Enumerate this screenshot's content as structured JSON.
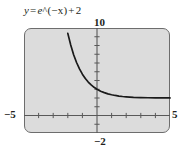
{
  "figure": {
    "equation": {
      "lhs": "y",
      "equals": "=",
      "base": "e",
      "caret": "^",
      "exponent": "(−x)",
      "plus": "+",
      "constant": "2",
      "full_text": "y = e^(−x) + 2"
    },
    "colors": {
      "plot_background": "#dcdcdc",
      "frame_border": "#6d6d6d",
      "axis": "#595959",
      "curve": "#1a1a1a",
      "text": "#231f20",
      "page_background": "#ffffff"
    }
  },
  "chart_data": {
    "type": "line",
    "xlabel": "",
    "ylabel": "",
    "xlim": [
      -5,
      5
    ],
    "ylim": [
      -2,
      10
    ],
    "grid": false,
    "legend": null,
    "axis_end_labels": {
      "x_min": "−5",
      "x_max": "5",
      "y_max": "10",
      "y_min": "−2"
    },
    "x_tick_step": 1,
    "y_tick_step": 1,
    "x_ticks": [
      -5,
      -4,
      -3,
      -2,
      -1,
      0,
      1,
      2,
      3,
      4,
      5
    ],
    "y_ticks": [
      -2,
      -1,
      0,
      1,
      2,
      3,
      4,
      5,
      6,
      7,
      8,
      9,
      10
    ],
    "asymptote": 2,
    "series": [
      {
        "name": "y = e^(−x) + 2",
        "x": [
          -2.2,
          -2.0,
          -1.8,
          -1.6,
          -1.4,
          -1.2,
          -1.0,
          -0.8,
          -0.6,
          -0.4,
          -0.2,
          0.0,
          0.25,
          0.5,
          0.75,
          1.0,
          1.25,
          1.5,
          1.75,
          2.0,
          2.5,
          3.0,
          3.5,
          4.0,
          4.5,
          5.0
        ],
        "y": [
          11.02,
          9.39,
          8.05,
          6.95,
          6.06,
          5.32,
          4.72,
          4.23,
          3.82,
          3.49,
          3.22,
          3.0,
          2.78,
          2.61,
          2.47,
          2.37,
          2.29,
          2.22,
          2.17,
          2.14,
          2.08,
          2.05,
          2.03,
          2.02,
          2.01,
          2.01
        ]
      }
    ]
  }
}
